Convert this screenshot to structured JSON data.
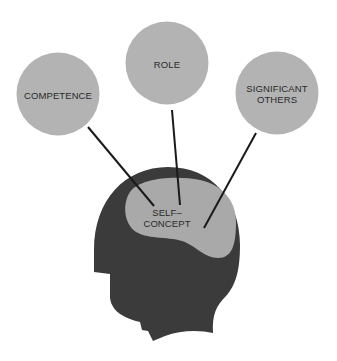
{
  "diagram": {
    "colors": {
      "background": "#ffffff",
      "circle_fill": "#b3b3b3",
      "head_fill": "#3b3b3b",
      "brain_fill": "#a9a9a9",
      "line": "#1a1a1a",
      "text": "#2a2a2a"
    },
    "nodes": [
      {
        "id": "competence",
        "label_lines": [
          "COMPETENCE"
        ],
        "cx": 58,
        "cy": 94,
        "r": 41
      },
      {
        "id": "role",
        "label_lines": [
          "ROLE"
        ],
        "cx": 167,
        "cy": 63,
        "r": 41
      },
      {
        "id": "significant-others",
        "label_lines": [
          "SIGNIFICANT",
          "OTHERS"
        ],
        "cx": 277,
        "cy": 93,
        "r": 41
      }
    ],
    "center": {
      "id": "self-concept",
      "label_lines": [
        "SELF–",
        "CONCEPT"
      ]
    },
    "edges": [
      {
        "from": "competence",
        "to": "self-concept"
      },
      {
        "from": "role",
        "to": "self-concept"
      },
      {
        "from": "significant-others",
        "to": "self-concept"
      }
    ]
  },
  "labels": {
    "competence": "COMPETENCE",
    "role": "ROLE",
    "significant_line1": "SIGNIFICANT",
    "significant_line2": "OTHERS",
    "self_line1": "SELF–",
    "self_line2": "CONCEPT"
  }
}
